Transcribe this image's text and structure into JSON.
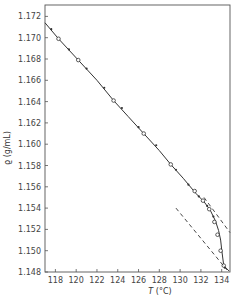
{
  "chart_data": {
    "type": "line",
    "title": "",
    "xlabel": "T (°C)",
    "ylabel": "ϱ (g/mL)",
    "xlim": [
      117.0,
      134.8
    ],
    "ylim": [
      1.148,
      1.173
    ],
    "grid": false,
    "legend": null,
    "x_ticks": [
      118,
      120,
      122,
      124,
      126,
      128,
      130,
      132,
      134
    ],
    "y_ticks": [
      1.148,
      1.15,
      1.152,
      1.154,
      1.156,
      1.158,
      1.16,
      1.162,
      1.164,
      1.166,
      1.168,
      1.17,
      1.172
    ],
    "series": [
      {
        "name": "density curve",
        "style": "solid",
        "x": [
          117.0,
          118.3,
          120.2,
          122.0,
          123.6,
          125.0,
          126.5,
          128.0,
          129.1,
          130.3,
          131.5,
          132.3,
          132.9,
          133.4,
          133.7,
          133.9,
          134.0,
          134.2,
          134.7
        ],
        "y": [
          1.1714,
          1.1699,
          1.1679,
          1.166,
          1.1641,
          1.1626,
          1.161,
          1.1594,
          1.1581,
          1.1568,
          1.1554,
          1.1546,
          1.1538,
          1.1528,
          1.1519,
          1.151,
          1.1501,
          1.1486,
          1.1481
        ]
      },
      {
        "name": "open circle points",
        "style": "markers-open-circle",
        "x": [
          118.3,
          120.2,
          123.6,
          126.5,
          129.1,
          131.4,
          132.2,
          132.8,
          133.3,
          133.6,
          133.9,
          134.2
        ],
        "y": [
          1.1699,
          1.1679,
          1.1641,
          1.161,
          1.1581,
          1.1556,
          1.1547,
          1.1539,
          1.1527,
          1.1515,
          1.15,
          1.1486
        ]
      },
      {
        "name": "filled points",
        "style": "markers-filled-dot",
        "x": [
          117.6,
          119.3,
          121.0,
          122.7,
          124.4,
          126.0,
          127.7,
          129.6,
          130.8,
          131.8,
          132.6,
          133.2,
          134.3
        ],
        "y": [
          1.1708,
          1.1689,
          1.1671,
          1.1653,
          1.1634,
          1.1616,
          1.1599,
          1.1576,
          1.1562,
          1.1551,
          1.1542,
          1.1532,
          1.1484
        ]
      },
      {
        "name": "upper dashed tangent",
        "style": "dashed",
        "x": [
          132.3,
          134.8
        ],
        "y": [
          1.155,
          1.1517
        ]
      },
      {
        "name": "lower dashed tangent",
        "style": "dashed",
        "x": [
          129.6,
          134.5
        ],
        "y": [
          1.154,
          1.1482
        ]
      }
    ]
  },
  "axes": {
    "x_label_var": "T",
    "x_label_unit": " (°C)",
    "y_label": "ϱ (g/mL)"
  },
  "colors": {
    "ink": "#333333",
    "frame": "#555555",
    "background": "#ffffff"
  }
}
